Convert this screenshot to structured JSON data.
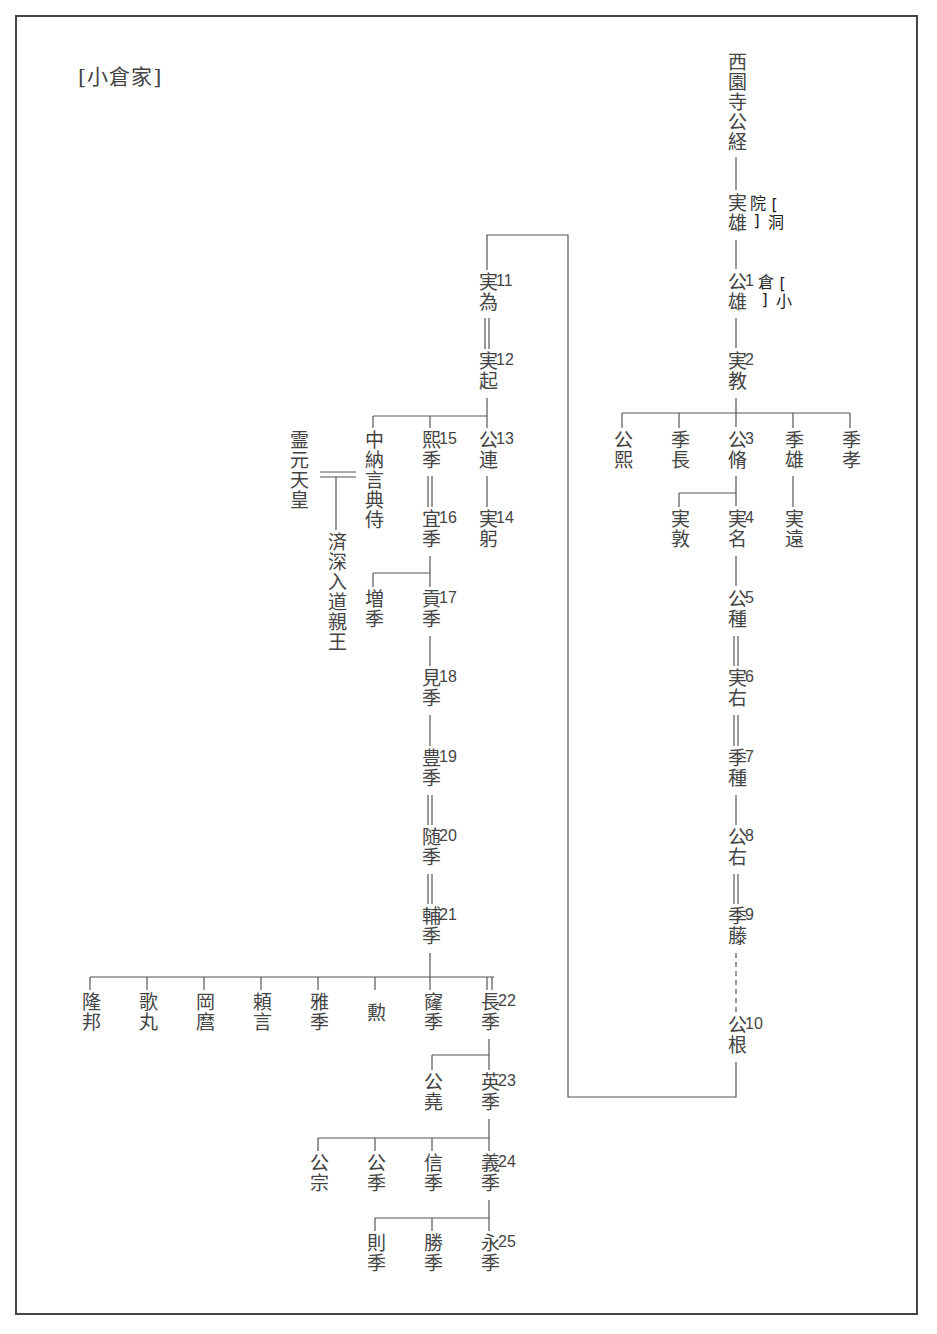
{
  "title": "[小倉家]",
  "tags": {
    "toin": "[洞院]",
    "ogura": "[小倉]"
  },
  "nodes": [
    {
      "id": "kintsune",
      "name": "西園寺公経",
      "num": "",
      "x": 736,
      "y": 52
    },
    {
      "id": "saneo",
      "name": "実雄",
      "num": "",
      "x": 736,
      "y": 193
    },
    {
      "id": "kinkatsu",
      "name": "公雄",
      "num": "1",
      "x": 736,
      "y": 272
    },
    {
      "id": "sanenori",
      "name": "実教",
      "num": "2",
      "x": 736,
      "y": 351
    },
    {
      "id": "kinhiro",
      "name": "公熙",
      "num": "",
      "x": 622,
      "y": 430
    },
    {
      "id": "suenaga",
      "name": "季長",
      "num": "",
      "x": 679,
      "y": 430
    },
    {
      "id": "kinnaga",
      "name": "公脩",
      "num": "3",
      "x": 736,
      "y": 430
    },
    {
      "id": "sueo",
      "name": "季雄",
      "num": "",
      "x": 793,
      "y": 430
    },
    {
      "id": "suetaka",
      "name": "季孝",
      "num": "",
      "x": 850,
      "y": 430
    },
    {
      "id": "saneatsu",
      "name": "実敦",
      "num": "",
      "x": 679,
      "y": 509
    },
    {
      "id": "sanena",
      "name": "実名",
      "num": "4",
      "x": 736,
      "y": 509
    },
    {
      "id": "saneto",
      "name": "実遠",
      "num": "",
      "x": 793,
      "y": 509
    },
    {
      "id": "kintane",
      "name": "公種",
      "num": "5",
      "x": 736,
      "y": 589
    },
    {
      "id": "saneaki",
      "name": "実右",
      "num": "6",
      "x": 736,
      "y": 668
    },
    {
      "id": "suetane",
      "name": "季種",
      "num": "7",
      "x": 736,
      "y": 748
    },
    {
      "id": "kinaki",
      "name": "公右",
      "num": "8",
      "x": 736,
      "y": 827
    },
    {
      "id": "suefuji",
      "name": "季藤",
      "num": "9",
      "x": 736,
      "y": 906
    },
    {
      "id": "kinne",
      "name": "公根",
      "num": "10",
      "x": 736,
      "y": 1015
    },
    {
      "id": "sanetame",
      "name": "実為",
      "num": "11",
      "x": 487,
      "y": 272
    },
    {
      "id": "saneoki",
      "name": "実起",
      "num": "12",
      "x": 487,
      "y": 351
    },
    {
      "id": "kinaki2",
      "name": "公連",
      "num": "13",
      "x": 487,
      "y": 430
    },
    {
      "id": "sanemi",
      "name": "実躬",
      "num": "14",
      "x": 487,
      "y": 509
    },
    {
      "id": "hirosue",
      "name": "熙季",
      "num": "15",
      "x": 430,
      "y": 430
    },
    {
      "id": "yoshisue",
      "name": "宜季",
      "num": "16",
      "x": 430,
      "y": 509
    },
    {
      "id": "masuse",
      "name": "増季",
      "num": "",
      "x": 373,
      "y": 589
    },
    {
      "id": "mitsugisue",
      "name": "貢季",
      "num": "17",
      "x": 430,
      "y": 589
    },
    {
      "id": "mise",
      "name": "見季",
      "num": "18",
      "x": 430,
      "y": 668
    },
    {
      "id": "toyosue",
      "name": "豊季",
      "num": "19",
      "x": 430,
      "y": 748
    },
    {
      "id": "yukisue",
      "name": "随季",
      "num": "20",
      "x": 430,
      "y": 827
    },
    {
      "id": "sukesue",
      "name": "輔季",
      "num": "21",
      "x": 430,
      "y": 906
    },
    {
      "id": "chunagon",
      "name": "中納言典侍",
      "num": "",
      "x": 373,
      "y": 430
    },
    {
      "id": "reigen",
      "name": "霊元天皇",
      "num": "",
      "x": 298,
      "y": 430
    },
    {
      "id": "saishin",
      "name": "済深入道親王",
      "num": "",
      "x": 336,
      "y": 532
    },
    {
      "id": "takakuni",
      "name": "隆邦",
      "num": "",
      "x": 90,
      "y": 992
    },
    {
      "id": "utamaru",
      "name": "歌丸",
      "num": "",
      "x": 147,
      "y": 992
    },
    {
      "id": "okamaro",
      "name": "岡麿",
      "num": "",
      "x": 204,
      "y": 992
    },
    {
      "id": "yorikoto",
      "name": "頼言",
      "num": "",
      "x": 261,
      "y": 992
    },
    {
      "id": "masasue",
      "name": "雅季",
      "num": "",
      "x": 318,
      "y": 992
    },
    {
      "id": "isao",
      "name": "勲",
      "num": "",
      "x": 375,
      "y": 1003
    },
    {
      "id": "takasue",
      "name": "窿季",
      "num": "",
      "x": 432,
      "y": 992
    },
    {
      "id": "nagasue",
      "name": "長季",
      "num": "22",
      "x": 489,
      "y": 992
    },
    {
      "id": "kintaka",
      "name": "公堯",
      "num": "",
      "x": 432,
      "y": 1072
    },
    {
      "id": "hidesue",
      "name": "英季",
      "num": "23",
      "x": 489,
      "y": 1072
    },
    {
      "id": "kinmune",
      "name": "公宗",
      "num": "",
      "x": 318,
      "y": 1153
    },
    {
      "id": "kinsue",
      "name": "公季",
      "num": "",
      "x": 375,
      "y": 1153
    },
    {
      "id": "nobusue",
      "name": "信季",
      "num": "",
      "x": 432,
      "y": 1153
    },
    {
      "id": "yoshisue2",
      "name": "義季",
      "num": "24",
      "x": 489,
      "y": 1153
    },
    {
      "id": "norisue",
      "name": "則季",
      "num": "",
      "x": 375,
      "y": 1233
    },
    {
      "id": "katsusue",
      "name": "勝季",
      "num": "",
      "x": 432,
      "y": 1233
    },
    {
      "id": "nagasue2",
      "name": "永季",
      "num": "25",
      "x": 489,
      "y": 1233
    }
  ],
  "legend": {
    "single_line": "実子 (blood child)",
    "double_line": "養子 (adopted)",
    "dashed_line": "中略 (omitted generations)"
  }
}
